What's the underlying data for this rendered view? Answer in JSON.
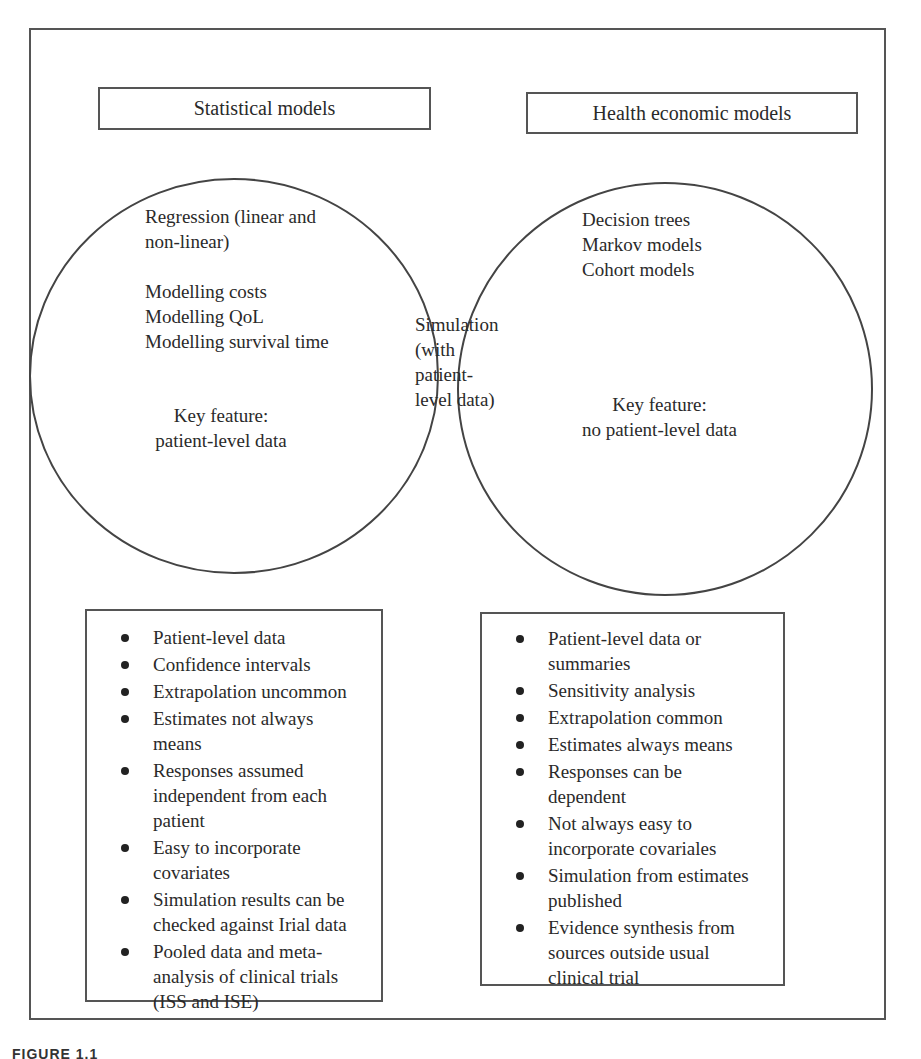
{
  "diagram": {
    "type": "venn",
    "left_set": {
      "title": "Statistical models",
      "items_text": "Regression (linear and\nnon-linear)\n\nModelling costs\nModelling QoL\nModelling survival time",
      "key_feature": "Key feature:\npatient-level data"
    },
    "right_set": {
      "title": "Health economic models",
      "items_text": "Decision trees\nMarkov models\nCohort models",
      "key_feature": "Key feature:\nno patient-level data"
    },
    "intersection": {
      "text": "Simulation\n(with\npatient-\nlevel data)"
    },
    "left_list": [
      "Patient-level data",
      "Confidence intervals",
      "Extrapolation uncommon",
      "Estimates not always\nmeans",
      "Responses assumed\nindependent from each\npatient",
      "Easy to incorporate\ncovariates",
      "Simulation results can be\nchecked against Irial data",
      "Pooled data and meta-\nanalysis of clinical trials\n(ISS and ISE)"
    ],
    "right_list": [
      "Patient-level data or\nsummaries",
      "Sensitivity analysis",
      "Extrapolation common",
      "Estimates always means",
      "Responses can be\ndependent",
      "Not always easy to\nincorporate covariales",
      "Simulation from estimates\npublished",
      "Evidence synthesis from\nsources outside usual\nclinical trial"
    ],
    "caption": "FIGURE 1.1"
  },
  "colors": {
    "line": "#555555",
    "text": "#2a2a2a",
    "background": "#ffffff"
  }
}
